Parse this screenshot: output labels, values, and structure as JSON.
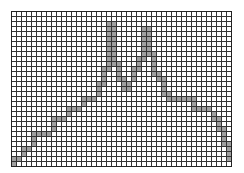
{
  "chart_data": {
    "type": "bar",
    "title": "",
    "subtitle": "",
    "xlabel": "",
    "ylabel": "",
    "grid": true,
    "legend": null,
    "annotations": [],
    "grid_columns": 44,
    "grid_rows": 31,
    "cell_size_px": 5,
    "grid_origin_px": [
      11,
      11
    ],
    "xlim": [
      0,
      44
    ],
    "ylim": [
      0,
      31
    ],
    "x_tick_labels": [],
    "y_tick_labels": [],
    "categories": [
      "1",
      "2",
      "3",
      "4",
      "5",
      "6",
      "7",
      "8",
      "9",
      "10",
      "11",
      "12",
      "13",
      "14",
      "15",
      "16",
      "17",
      "18",
      "19",
      "20",
      "21",
      "22",
      "23",
      "24",
      "25",
      "26",
      "27",
      "28",
      "29",
      "30",
      "31",
      "32",
      "33",
      "34",
      "35",
      "36",
      "37",
      "38",
      "39",
      "40",
      "41",
      "42",
      "43",
      "44"
    ],
    "values": [
      1,
      1,
      4,
      4,
      7,
      7,
      7,
      7,
      10,
      10,
      12,
      12,
      12,
      14,
      14,
      17,
      17,
      20,
      24,
      29,
      29,
      24,
      21,
      21,
      23,
      26,
      29,
      26,
      22,
      22,
      18,
      16,
      16,
      16,
      16,
      16,
      13,
      13,
      13,
      13,
      10,
      8,
      4,
      2
    ],
    "series": [
      {
        "name": "profile",
        "values": [
          1,
          1,
          4,
          4,
          7,
          7,
          7,
          7,
          10,
          10,
          12,
          12,
          12,
          14,
          14,
          17,
          17,
          20,
          24,
          29,
          29,
          24,
          21,
          21,
          23,
          26,
          29,
          26,
          22,
          22,
          18,
          16,
          16,
          16,
          16,
          16,
          13,
          13,
          13,
          13,
          10,
          8,
          4,
          2
        ]
      }
    ],
    "outline_cells": [
      [
        0,
        30
      ],
      [
        0,
        29
      ],
      [
        1,
        29
      ],
      [
        2,
        28
      ],
      [
        2,
        27
      ],
      [
        3,
        27
      ],
      [
        4,
        26
      ],
      [
        4,
        25
      ],
      [
        4,
        24
      ],
      [
        5,
        24
      ],
      [
        6,
        24
      ],
      [
        7,
        24
      ],
      [
        8,
        23
      ],
      [
        8,
        22
      ],
      [
        8,
        21
      ],
      [
        9,
        21
      ],
      [
        10,
        21
      ],
      [
        11,
        20
      ],
      [
        11,
        19
      ],
      [
        12,
        19
      ],
      [
        13,
        19
      ],
      [
        14,
        18
      ],
      [
        14,
        17
      ],
      [
        15,
        17
      ],
      [
        16,
        17
      ],
      [
        17,
        16
      ],
      [
        17,
        15
      ],
      [
        17,
        14
      ],
      [
        18,
        14
      ],
      [
        18,
        13
      ],
      [
        18,
        12
      ],
      [
        18,
        11
      ],
      [
        19,
        11
      ],
      [
        19,
        10
      ],
      [
        19,
        9
      ],
      [
        19,
        8
      ],
      [
        19,
        7
      ],
      [
        19,
        6
      ],
      [
        19,
        5
      ],
      [
        19,
        4
      ],
      [
        19,
        3
      ],
      [
        19,
        2
      ],
      [
        20,
        2
      ],
      [
        20,
        3
      ],
      [
        20,
        4
      ],
      [
        20,
        5
      ],
      [
        20,
        6
      ],
      [
        20,
        7
      ],
      [
        20,
        8
      ],
      [
        20,
        9
      ],
      [
        20,
        10
      ],
      [
        21,
        10
      ],
      [
        21,
        11
      ],
      [
        21,
        12
      ],
      [
        21,
        13
      ],
      [
        22,
        13
      ],
      [
        22,
        14
      ],
      [
        22,
        15
      ],
      [
        23,
        15
      ],
      [
        23,
        14
      ],
      [
        24,
        13
      ],
      [
        24,
        12
      ],
      [
        24,
        11
      ],
      [
        25,
        11
      ],
      [
        25,
        10
      ],
      [
        25,
        9
      ],
      [
        26,
        9
      ],
      [
        26,
        8
      ],
      [
        26,
        7
      ],
      [
        26,
        6
      ],
      [
        26,
        5
      ],
      [
        26,
        4
      ],
      [
        26,
        3
      ],
      [
        27,
        3
      ],
      [
        27,
        4
      ],
      [
        27,
        5
      ],
      [
        27,
        6
      ],
      [
        27,
        7
      ],
      [
        27,
        8
      ],
      [
        28,
        8
      ],
      [
        28,
        9
      ],
      [
        28,
        10
      ],
      [
        28,
        11
      ],
      [
        28,
        12
      ],
      [
        29,
        12
      ],
      [
        29,
        13
      ],
      [
        30,
        13
      ],
      [
        30,
        14
      ],
      [
        30,
        15
      ],
      [
        30,
        16
      ],
      [
        31,
        16
      ],
      [
        31,
        17
      ],
      [
        32,
        17
      ],
      [
        33,
        17
      ],
      [
        34,
        17
      ],
      [
        35,
        17
      ],
      [
        36,
        17
      ],
      [
        36,
        18
      ],
      [
        36,
        19
      ],
      [
        37,
        19
      ],
      [
        38,
        19
      ],
      [
        39,
        19
      ],
      [
        40,
        20
      ],
      [
        40,
        21
      ],
      [
        41,
        21
      ],
      [
        41,
        22
      ],
      [
        41,
        23
      ],
      [
        42,
        23
      ],
      [
        42,
        24
      ],
      [
        42,
        25
      ],
      [
        42,
        26
      ],
      [
        43,
        26
      ],
      [
        43,
        27
      ],
      [
        43,
        28
      ],
      [
        43,
        29
      ]
    ],
    "colors": {
      "grid_line": "#333333",
      "grid_minor": "#999999",
      "fill": "#a0a0a0",
      "background": "#ffffff",
      "border": "#222222"
    }
  },
  "figure": {
    "name": "grid-profile-chart"
  }
}
